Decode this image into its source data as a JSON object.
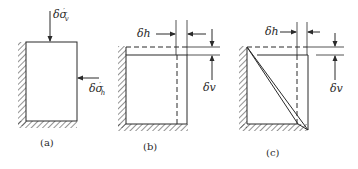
{
  "figure": {
    "panels": [
      {
        "id": "a",
        "caption": "(a)",
        "labels": {
          "vertical_stress": {
            "symbol": "δσ",
            "prime": "′",
            "subscript": "v"
          },
          "horizontal_stress": {
            "symbol": "δσ",
            "prime": "′",
            "subscript": "h"
          }
        }
      },
      {
        "id": "b",
        "caption": "(b)",
        "labels": {
          "horizontal_disp": "δh",
          "vertical_disp": "δv"
        }
      },
      {
        "id": "c",
        "caption": "(c)",
        "labels": {
          "horizontal_disp": "δh",
          "vertical_disp": "δv"
        }
      }
    ],
    "colors": {
      "line": "#2a2a2a",
      "background": "#ffffff"
    }
  }
}
